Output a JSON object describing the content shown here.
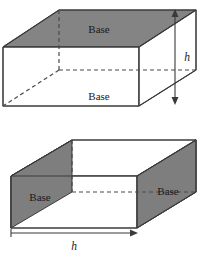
{
  "figure": {
    "title": "",
    "colors": {
      "shaded_face": "#848484",
      "shaded_face_alt": "#7e7e7e",
      "outline": "#3a3a3a",
      "dashed": "#4a4a4a",
      "background": "#ffffff",
      "text": "#1a1a1a"
    },
    "prism_top": {
      "name": "rectangular-prism-horizontal-bases",
      "labels": {
        "top_base": "Base",
        "bottom_base": "Base",
        "height": "h"
      },
      "height_arrow": {
        "orientation": "vertical",
        "label": "h",
        "x": 175,
        "y_top": 10,
        "y_bottom": 104
      },
      "vertices": {
        "front_top_left": [
          3,
          47
        ],
        "front_top_right": [
          139,
          47
        ],
        "front_bottom_left": [
          3,
          106
        ],
        "front_bottom_right": [
          139,
          106
        ],
        "back_top_left": [
          59,
          10
        ],
        "back_top_right": [
          196,
          10
        ],
        "back_bottom_left": [
          59,
          70
        ],
        "back_bottom_right": [
          196,
          70
        ]
      }
    },
    "prism_bottom": {
      "name": "rectangular-prism-vertical-bases",
      "labels": {
        "left_base": "Base",
        "right_base": "Base",
        "height": "h"
      },
      "height_arrow": {
        "orientation": "horizontal",
        "label": "h",
        "y": 233,
        "x_left": 11,
        "x_right": 137
      },
      "vertices": {
        "front_top_left": [
          11,
          176
        ],
        "front_top_right": [
          137,
          176
        ],
        "front_bottom_left": [
          11,
          228
        ],
        "front_bottom_right": [
          137,
          228
        ],
        "back_top_left": [
          72,
          140
        ],
        "back_top_right": [
          196,
          140
        ],
        "back_bottom_left": [
          72,
          192
        ],
        "back_bottom_right": [
          196,
          192
        ]
      }
    }
  }
}
